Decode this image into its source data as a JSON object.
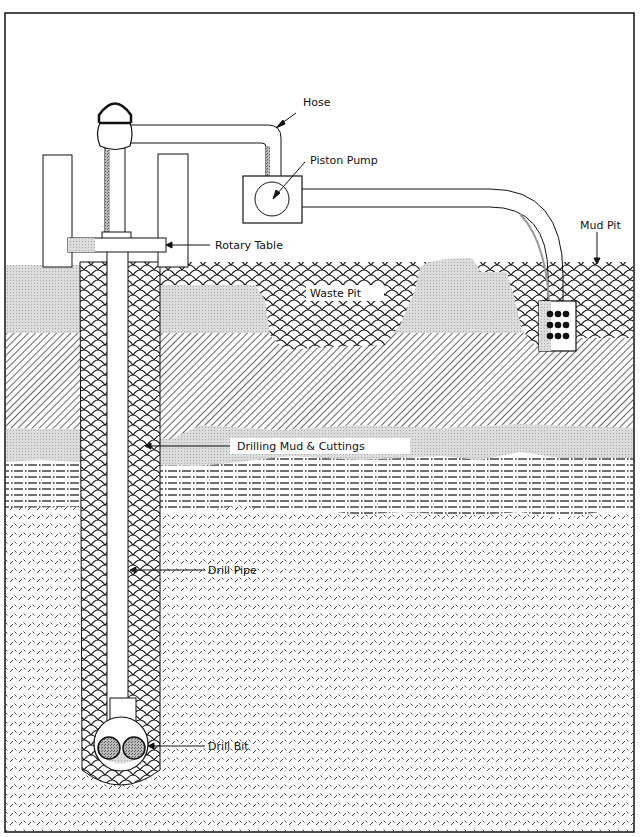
{
  "diagram": {
    "labels": {
      "hose": "Hose",
      "piston_pump": "Piston Pump",
      "rotary_table": "Rotary Table",
      "mud_pit": "Mud Pit",
      "waste_pit": "Waste Pit",
      "drilling_mud": "Drilling Mud & Cuttings",
      "drill_pipe": "Drill Pipe",
      "drill_bit": "Drill Bit"
    },
    "colors": {
      "ink": "#111111",
      "paper": "#ffffff",
      "gray_layer": "#d9d9d9",
      "shade": "#bdbdbd"
    }
  }
}
